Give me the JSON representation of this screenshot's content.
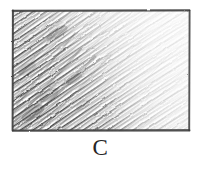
{
  "figure": {
    "kind": "hand-drawn pencil sketch",
    "medium": "graphite pencil on paper",
    "caption": "C",
    "background_color": "#ffffff",
    "frame": {
      "shape": "rectangle",
      "stroke_color": "#3a3a3a",
      "x": 11,
      "y": 9,
      "width": 180,
      "height": 123
    },
    "shading": {
      "technique": "diagonal hatching",
      "hatch_direction": "lower-left to upper-right",
      "gradient": "dark at left edge fading to near-white at right edge",
      "dark_color": "#4a4a4a",
      "mid_color": "#9a9a9a",
      "light_color": "#f2f2f2"
    }
  }
}
